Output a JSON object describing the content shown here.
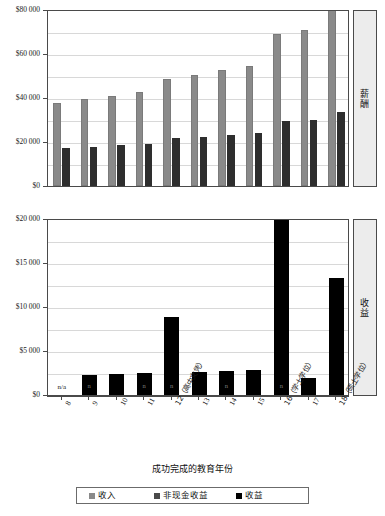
{
  "chart_data": [
    {
      "type": "bar",
      "id": "compensation",
      "panel_label": "薪酬",
      "title": "",
      "xlabel": "成功完成的教育年份",
      "ylabel": "",
      "ylim": [
        0,
        80000
      ],
      "grid": true,
      "ytick_labels": [
        "$80 000",
        "$60 000",
        "$40 000",
        "$20 000",
        "$0"
      ],
      "ytick_values": [
        80000,
        60000,
        40000,
        20000,
        0
      ],
      "categories": [
        "8",
        "9",
        "10",
        "11",
        "12",
        "13",
        "14",
        "15",
        "16",
        "17",
        "18"
      ],
      "series": [
        {
          "name": "收入",
          "color": "#8a8a8a",
          "values": [
            37600,
            39300,
            40800,
            42400,
            48300,
            50300,
            52300,
            54400,
            68800,
            70300,
            82000
          ]
        },
        {
          "name": "收益",
          "color": "#2e2e2e",
          "values": [
            17000,
            17700,
            18400,
            19200,
            21500,
            22300,
            23200,
            24000,
            29500,
            29900,
            33400
          ]
        }
      ],
      "clipped_note": "last 收入 bar exceeds axis maximum"
    },
    {
      "type": "bar",
      "id": "benefits",
      "panel_label": "收益",
      "title": "",
      "xlabel": "成功完成的教育年份",
      "ylabel": "",
      "ylim": [
        0,
        20000
      ],
      "grid": true,
      "ytick_labels": [
        "$20 000",
        "$15 000",
        "$10 000",
        "$5 000",
        "$0"
      ],
      "ytick_values": [
        20000,
        15000,
        10000,
        5000,
        0
      ],
      "categories": [
        "8",
        "9",
        "10",
        "11",
        "12",
        "13",
        "14",
        "15",
        "16",
        "17",
        "18"
      ],
      "series": [
        {
          "name": "收益",
          "color": "#000000",
          "values": [
            0,
            2300,
            2400,
            2500,
            8800,
            2650,
            2750,
            2850,
            21000,
            1900,
            13200
          ]
        }
      ],
      "point_annotations": [
        {
          "category": "8",
          "text": "n/a"
        },
        {
          "category": "9",
          "text": "n"
        },
        {
          "category": "11",
          "text": "n"
        },
        {
          "category": "12",
          "text": "n"
        },
        {
          "category": "14",
          "text": "n"
        },
        {
          "category": "16",
          "text": "n"
        }
      ],
      "clipped_note": "year 16 bar exceeds axis maximum"
    }
  ],
  "axis": {
    "x_title": "成功完成的教育年份",
    "x_tick_labels": [
      "8",
      "9",
      "10",
      "11",
      "12（高中文凭）",
      "13",
      "14",
      "15",
      "16（学士学位）",
      "17",
      "18（硕士学位）"
    ]
  },
  "legend": {
    "items": [
      {
        "label": "收入",
        "color": "#8a8a8a"
      },
      {
        "label": "非现金收益",
        "color": "#4a4a4a"
      },
      {
        "label": "收益",
        "color": "#000000"
      }
    ]
  }
}
